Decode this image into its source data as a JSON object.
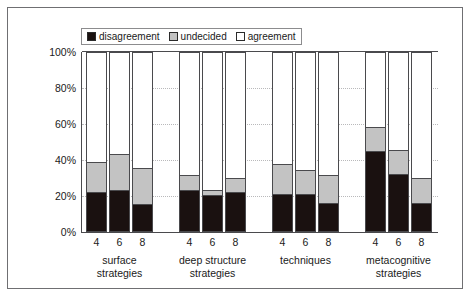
{
  "chart_data": {
    "type": "bar",
    "subtype": "stacked-percentage",
    "title": "",
    "xlabel": "",
    "ylabel": "",
    "ylim": [
      0,
      100
    ],
    "y_ticks": [
      "0%",
      "20%",
      "40%",
      "60%",
      "80%",
      "100%"
    ],
    "y_tick_values": [
      0,
      20,
      40,
      60,
      80,
      100
    ],
    "grid": true,
    "legend_position": "top",
    "legend": [
      {
        "label": "disagreement",
        "color": "#1a1110"
      },
      {
        "label": "undecided",
        "color": "#c3c3c3"
      },
      {
        "label": "agreement",
        "color": "#ffffff"
      }
    ],
    "groups": [
      {
        "name": "surface\nstrategies",
        "categories": [
          "4",
          "6",
          "8"
        ],
        "bars": [
          {
            "category": "4",
            "disagreement": 21.5,
            "undecided": 17.0,
            "agreement": 61.5
          },
          {
            "category": "6",
            "disagreement": 23.0,
            "undecided": 20.0,
            "agreement": 57.0
          },
          {
            "category": "8",
            "disagreement": 15.0,
            "undecided": 20.0,
            "agreement": 65.0
          }
        ]
      },
      {
        "name": "deep structure\nstrategies",
        "categories": [
          "4",
          "6",
          "8"
        ],
        "bars": [
          {
            "category": "4",
            "disagreement": 23.0,
            "undecided": 8.0,
            "agreement": 69.0
          },
          {
            "category": "6",
            "disagreement": 20.0,
            "undecided": 3.0,
            "agreement": 77.0
          },
          {
            "category": "8",
            "disagreement": 21.5,
            "undecided": 8.0,
            "agreement": 70.5
          }
        ]
      },
      {
        "name": "techniques",
        "categories": [
          "4",
          "6",
          "8"
        ],
        "bars": [
          {
            "category": "4",
            "disagreement": 20.5,
            "undecided": 16.5,
            "agreement": 63.0
          },
          {
            "category": "6",
            "disagreement": 20.5,
            "undecided": 13.5,
            "agreement": 66.0
          },
          {
            "category": "8",
            "disagreement": 15.5,
            "undecided": 15.5,
            "agreement": 69.0
          }
        ]
      },
      {
        "name": "metacognitive\nstrategies",
        "categories": [
          "4",
          "6",
          "8"
        ],
        "bars": [
          {
            "category": "4",
            "disagreement": 44.5,
            "undecided": 13.5,
            "agreement": 42.0
          },
          {
            "category": "6",
            "disagreement": 31.5,
            "undecided": 13.5,
            "agreement": 55.0
          },
          {
            "category": "8",
            "disagreement": 15.5,
            "undecided": 14.0,
            "agreement": 70.5
          }
        ]
      }
    ]
  },
  "colors": {
    "frame": "#6f6f72",
    "axis": "#4a4a4d",
    "grid": "#b9b9bb",
    "disagreement": "#1a1110",
    "undecided": "#c3c3c3",
    "agreement": "#ffffff",
    "text": "#1a1a1a"
  }
}
